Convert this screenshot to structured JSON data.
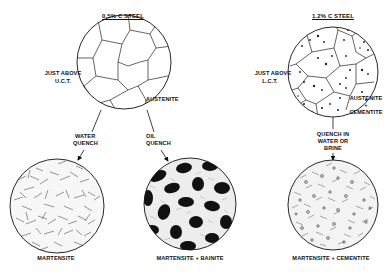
{
  "diagram": {
    "left_section": {
      "title": "0.5% C STEEL",
      "condition_line1": "JUST ABOVE",
      "condition_line2": "U.C.T.",
      "phase_label": "AUSTENITE",
      "quench_paths": [
        {
          "line1": "WATER",
          "line2": "QUENCH",
          "result": "MARTENSITE"
        },
        {
          "line1": "OIL",
          "line2": "QUENCH",
          "result": "MARTENSITE + BAINITE"
        }
      ]
    },
    "right_section": {
      "title": "1.2% C STEEL",
      "condition_line1": "JUST ABOVE",
      "condition_line2": "L.C.T.",
      "phase_label_line1": "AUSTENITE",
      "phase_label_line2": "+",
      "phase_label_line3": "CEMENTITE",
      "quench_path": {
        "line1": "QUENCH IN",
        "line2": "WATER OR",
        "line3": "BRINE",
        "result": "MARTENSITE + CEMENTITE"
      }
    },
    "colors": {
      "ink": "#111111",
      "background": "#ffffff"
    }
  }
}
